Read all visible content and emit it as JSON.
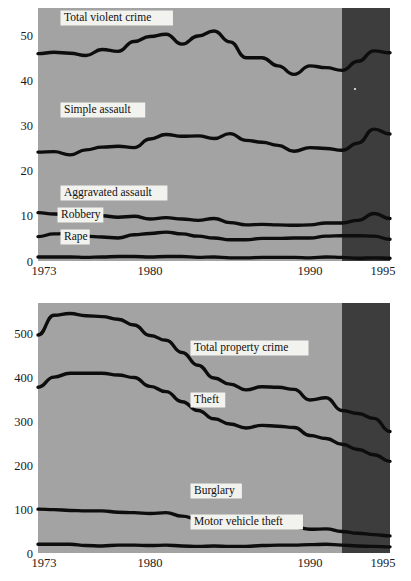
{
  "figure": {
    "panels": [
      {
        "name": "violent-crime-panel",
        "shade_start_year": 1992,
        "shade_end_year": 1995,
        "yaxis": {
          "ticks": [
            "0",
            "10",
            "20",
            "30",
            "40",
            "50"
          ]
        },
        "xaxis": {
          "ticks": [
            "1973",
            "1980",
            "1990",
            "1995"
          ]
        },
        "labels": [
          {
            "text": "Total violent crime",
            "name": "label-total-violent-crime"
          },
          {
            "text": "Simple assault",
            "name": "label-simple-assault"
          },
          {
            "text": "Aggravated assault",
            "name": "label-aggravated-assault"
          },
          {
            "text": "Robbery",
            "name": "label-robbery"
          },
          {
            "text": "Rape",
            "name": "label-rape"
          }
        ]
      },
      {
        "name": "property-crime-panel",
        "shade_start_year": 1992,
        "shade_end_year": 1995,
        "yaxis": {
          "ticks": [
            "0",
            "100",
            "200",
            "300",
            "400",
            "500"
          ]
        },
        "xaxis": {
          "ticks": [
            "1973",
            "1980",
            "1990",
            "1995"
          ]
        },
        "labels": [
          {
            "text": "Total property crime",
            "name": "label-total-property-crime"
          },
          {
            "text": "Theft",
            "name": "label-theft"
          },
          {
            "text": "Burglary",
            "name": "label-burglary"
          },
          {
            "text": "Motor vehicle theft",
            "name": "label-motor-vehicle-theft"
          }
        ]
      }
    ]
  },
  "chart_data": [
    {
      "type": "line",
      "name": "violent-crime-rates",
      "title": "",
      "xlabel": "",
      "ylabel": "",
      "xlim": [
        1973,
        1995
      ],
      "ylim": [
        0,
        56
      ],
      "grid": false,
      "legend": "inline-labels",
      "xticks": [
        1973,
        1980,
        1990,
        1995
      ],
      "yticks": [
        0,
        10,
        20,
        30,
        40,
        50
      ],
      "x": [
        1973,
        1974,
        1975,
        1976,
        1977,
        1978,
        1979,
        1980,
        1981,
        1982,
        1983,
        1984,
        1985,
        1986,
        1987,
        1988,
        1989,
        1990,
        1991,
        1992,
        1993,
        1994,
        1995
      ],
      "series": [
        {
          "name": "Total violent crime",
          "values": [
            45.9,
            46.2,
            46.0,
            45.5,
            46.8,
            46.4,
            48.6,
            49.7,
            50.2,
            48.0,
            49.8,
            50.9,
            48.5,
            45.0,
            45.0,
            43.2,
            41.3,
            43.2,
            42.8,
            42.2,
            44.2,
            46.5,
            46.1
          ]
        },
        {
          "name": "Simple assault",
          "values": [
            24.1,
            24.2,
            23.5,
            24.6,
            25.2,
            25.4,
            25.1,
            27.0,
            28.0,
            27.6,
            27.7,
            27.1,
            28.2,
            26.7,
            26.3,
            25.6,
            24.3,
            25.1,
            24.9,
            24.5,
            26.1,
            29.2,
            28.1
          ]
        },
        {
          "name": "Aggravated assault",
          "values": [
            10.7,
            10.4,
            10.3,
            9.9,
            10.0,
            9.7,
            9.9,
            9.3,
            9.6,
            9.3,
            9.0,
            9.4,
            8.5,
            8.0,
            8.1,
            8.0,
            7.9,
            8.0,
            8.4,
            8.4,
            9.0,
            10.5,
            9.4
          ]
        },
        {
          "name": "Robbery",
          "values": [
            5.4,
            6.0,
            6.1,
            5.5,
            5.3,
            5.1,
            5.8,
            6.1,
            6.4,
            6.0,
            5.5,
            5.1,
            4.7,
            4.7,
            5.0,
            5.0,
            5.1,
            5.1,
            5.5,
            5.6,
            5.6,
            5.5,
            4.8
          ]
        },
        {
          "name": "Rape",
          "values": [
            0.9,
            0.9,
            0.9,
            0.8,
            0.9,
            1.0,
            1.0,
            0.9,
            1.0,
            1.0,
            0.8,
            0.9,
            0.7,
            0.7,
            0.8,
            0.8,
            0.8,
            0.7,
            0.9,
            0.8,
            0.6,
            0.7,
            0.6
          ]
        }
      ]
    },
    {
      "type": "line",
      "name": "property-crime-rates",
      "title": "",
      "xlabel": "",
      "ylabel": "",
      "xlim": [
        1973,
        1995
      ],
      "ylim": [
        0,
        570
      ],
      "grid": false,
      "legend": "inline-labels",
      "xticks": [
        1973,
        1980,
        1990,
        1995
      ],
      "yticks": [
        0,
        100,
        200,
        300,
        400,
        500
      ],
      "x": [
        1973,
        1974,
        1975,
        1976,
        1977,
        1978,
        1979,
        1980,
        1981,
        1982,
        1983,
        1984,
        1985,
        1986,
        1987,
        1988,
        1989,
        1990,
        1991,
        1992,
        1993,
        1994,
        1995
      ],
      "series": [
        {
          "name": "Total property crime",
          "values": [
            497,
            542,
            546,
            541,
            539,
            533,
            520,
            496,
            485,
            457,
            428,
            399,
            385,
            372,
            379,
            378,
            373,
            349,
            354,
            325,
            318,
            307,
            277
          ]
        },
        {
          "name": "Theft",
          "values": [
            378,
            401,
            410,
            410,
            410,
            406,
            400,
            380,
            368,
            345,
            325,
            306,
            294,
            285,
            291,
            289,
            286,
            268,
            261,
            248,
            236,
            224,
            209
          ]
        },
        {
          "name": "Burglary",
          "values": [
            100,
            99,
            97,
            96,
            96,
            93,
            92,
            90,
            92,
            84,
            77,
            69,
            65,
            62,
            62,
            60,
            59,
            54,
            55,
            49,
            45,
            42,
            39
          ]
        },
        {
          "name": "Motor vehicle theft",
          "values": [
            20,
            20,
            20,
            17,
            16,
            18,
            18,
            17,
            18,
            16,
            15,
            16,
            15,
            15,
            17,
            18,
            18,
            19,
            20,
            18,
            16,
            15,
            14
          ]
        }
      ]
    }
  ]
}
